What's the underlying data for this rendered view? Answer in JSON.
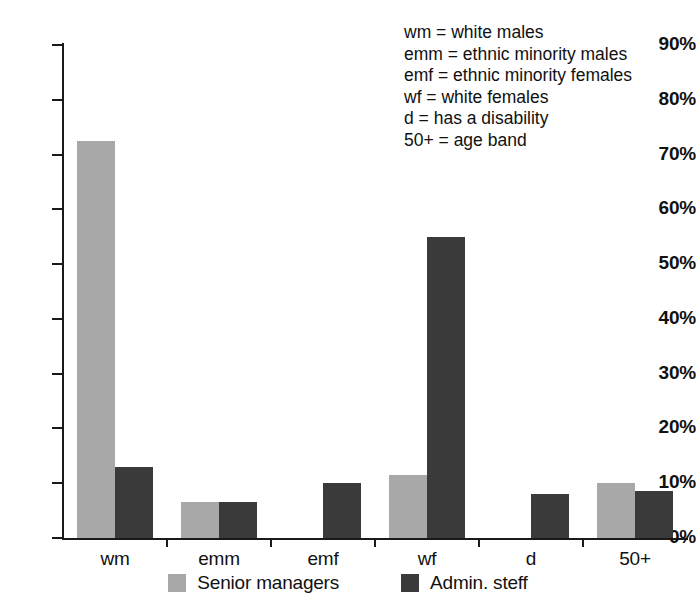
{
  "chart_data": {
    "type": "bar",
    "title": "",
    "xlabel": "",
    "ylabel": "",
    "ylim": [
      0,
      90
    ],
    "grid": false,
    "legend_position": "bottom-center",
    "categories": [
      "wm",
      "emm",
      "emf",
      "wf",
      "d",
      "50+"
    ],
    "ytick_labels": [
      "0%",
      "10%",
      "20%",
      "30%",
      "40%",
      "50%",
      "60%",
      "70%",
      "80%",
      "90%"
    ],
    "ytick_values": [
      0,
      10,
      20,
      30,
      40,
      50,
      60,
      70,
      80,
      90
    ],
    "series": [
      {
        "name": "Senior managers",
        "color": "#a8a8a8",
        "values": [
          72.5,
          6.5,
          0,
          11.5,
          0,
          10
        ]
      },
      {
        "name": "Admin. steff",
        "color": "#3a3a3a",
        "values": [
          13,
          6.5,
          10,
          55,
          8,
          8.5
        ]
      }
    ],
    "annotations": [
      "wm = white males",
      "emm = ethnic minority males",
      "emf = ethnic minority females",
      "wf = white females",
      "d = has a disability",
      "50+ = age band"
    ]
  },
  "abbrev_key": {
    "lines": [
      "wm = white males",
      "emm = ethnic minority males",
      "emf = ethnic minority females",
      "wf = white females",
      "d = has a disability",
      "50+ = age band"
    ]
  },
  "legend": {
    "entries": [
      {
        "label": "Senior managers",
        "color": "#a8a8a8"
      },
      {
        "label": "Admin. steff",
        "color": "#3a3a3a"
      }
    ]
  }
}
